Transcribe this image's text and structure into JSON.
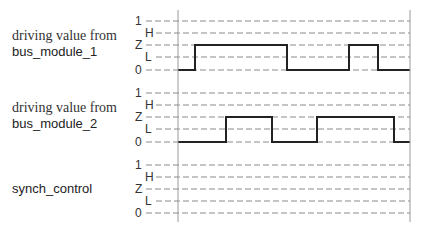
{
  "diagram": {
    "type": "timing-diagram",
    "levels": [
      "1",
      "H",
      "Z",
      "L",
      "0"
    ],
    "time_axis": {
      "start_x": 178,
      "end_x": 410,
      "top_y": 10,
      "bottom_y": 222
    },
    "colors": {
      "waveform": "#222222",
      "grid": "#8a8a8a",
      "text": "#333333"
    },
    "signals": [
      {
        "id": "bus_module_1",
        "caption_line1": "driving value from",
        "caption_line2": "bus_module_1",
        "level_y": {
          "1": 21,
          "H": 33,
          "Z": 45,
          "L": 57,
          "0": 70
        },
        "waveform": [
          {
            "from_x": 178,
            "to_x": 195,
            "level": "0"
          },
          {
            "from_x": 195,
            "to_x": 287,
            "level": "Z"
          },
          {
            "from_x": 287,
            "to_x": 349,
            "level": "0"
          },
          {
            "from_x": 349,
            "to_x": 378,
            "level": "Z"
          },
          {
            "from_x": 378,
            "to_x": 410,
            "level": "0"
          }
        ]
      },
      {
        "id": "bus_module_2",
        "caption_line1": "driving value from",
        "caption_line2": "bus_module_2",
        "level_y": {
          "1": 93,
          "H": 105,
          "Z": 117,
          "L": 129,
          "0": 142
        },
        "waveform": [
          {
            "from_x": 178,
            "to_x": 226,
            "level": "0"
          },
          {
            "from_x": 226,
            "to_x": 272,
            "level": "Z"
          },
          {
            "from_x": 272,
            "to_x": 317,
            "level": "0"
          },
          {
            "from_x": 317,
            "to_x": 394,
            "level": "Z"
          },
          {
            "from_x": 394,
            "to_x": 410,
            "level": "0"
          }
        ]
      },
      {
        "id": "synch_control",
        "caption_line1": "",
        "caption_line2": "synch_control",
        "level_y": {
          "1": 165,
          "H": 177,
          "Z": 189,
          "L": 201,
          "0": 213
        },
        "waveform": []
      }
    ]
  }
}
